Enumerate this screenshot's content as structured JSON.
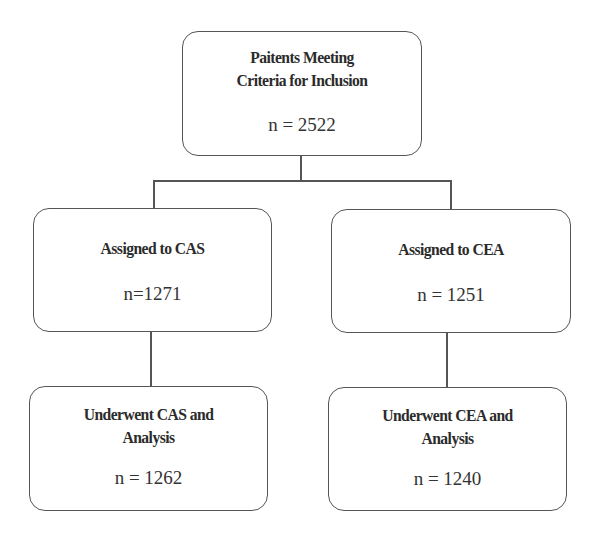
{
  "diagram": {
    "type": "flowchart",
    "nodes": {
      "inclusion": {
        "title_lines": [
          "Paitents Meeting",
          "Criteria for Inclusion"
        ],
        "count": "n = 2522"
      },
      "assigned_cas": {
        "title_lines": [
          "Assigned to CAS"
        ],
        "count": "n=1271"
      },
      "assigned_cea": {
        "title_lines": [
          "Assigned to CEA"
        ],
        "count": "n = 1251"
      },
      "underwent_cas": {
        "title_lines": [
          "Underwent CAS and",
          "Analysis"
        ],
        "count": "n = 1262"
      },
      "underwent_cea": {
        "title_lines": [
          "Underwent CEA and",
          "Analysis"
        ],
        "count": "n = 1240"
      }
    },
    "edges": [
      {
        "from": "inclusion",
        "to": "assigned_cas"
      },
      {
        "from": "inclusion",
        "to": "assigned_cea"
      },
      {
        "from": "assigned_cas",
        "to": "underwent_cas"
      },
      {
        "from": "assigned_cea",
        "to": "underwent_cea"
      }
    ],
    "colors": {
      "stroke": "#555555",
      "text": "#2b2b2b",
      "background": "#ffffff"
    }
  }
}
